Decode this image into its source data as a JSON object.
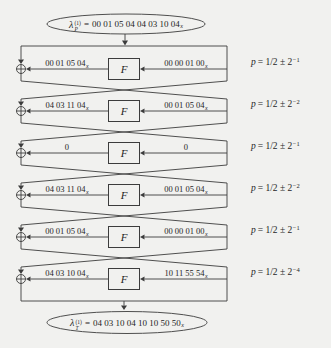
{
  "header": {
    "lambda": "λ",
    "sub": "P",
    "sup": "(1)",
    "equals": "=",
    "value": "00 01 05 04 04 03 10 04",
    "subscript": "x"
  },
  "footer": {
    "lambda": "λ",
    "sub": "T",
    "sup": "(1)",
    "equals": "=",
    "value": "04 03 10 04 10 10 50 50",
    "subscript": "x"
  },
  "f_label": "F",
  "colors": {
    "line": "#3c3c3c",
    "background": "#f1f1ef",
    "text": "#1f1f1f"
  },
  "rounds": [
    {
      "left": {
        "value": "00 01 05 04",
        "sub": "x"
      },
      "right": {
        "value": "00 00 01 00",
        "sub": "x"
      },
      "p": {
        "var": "p",
        "base": "= 1/2 ± 2",
        "exp": "−1"
      }
    },
    {
      "left": {
        "value": "04 03 11 04",
        "sub": "x"
      },
      "right": {
        "value": "00 01 05 04",
        "sub": "x"
      },
      "p": {
        "var": "p",
        "base": "= 1/2 ± 2",
        "exp": "−2"
      }
    },
    {
      "left": {
        "value": "0",
        "sub": ""
      },
      "right": {
        "value": "0",
        "sub": ""
      },
      "p": {
        "var": "p",
        "base": "= 1/2 ± 2",
        "exp": "−1"
      }
    },
    {
      "left": {
        "value": "04 03 11 04",
        "sub": "x"
      },
      "right": {
        "value": "00 01 05 04",
        "sub": "x"
      },
      "p": {
        "var": "p",
        "base": "= 1/2 ± 2",
        "exp": "−2"
      }
    },
    {
      "left": {
        "value": "00 01 05 04",
        "sub": "x"
      },
      "right": {
        "value": "00 00 01 00",
        "sub": "x"
      },
      "p": {
        "var": "p",
        "base": "= 1/2 ± 2",
        "exp": "−1"
      }
    },
    {
      "left": {
        "value": "04 03 10 04",
        "sub": "x"
      },
      "right": {
        "value": "10 11 55 54",
        "sub": "x"
      },
      "p": {
        "var": "p",
        "base": "= 1/2 ± 2",
        "exp": "−4"
      }
    }
  ]
}
